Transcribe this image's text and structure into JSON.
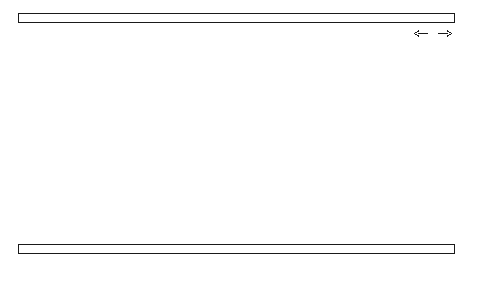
{
  "figure": {
    "kind": "nmr-spectrum",
    "background_color": "#ffffff",
    "line_color": "#1a1a1a",
    "trace_color": "#3a3a3a"
  },
  "annotation": {
    "label": "H",
    "left_arrow": "←",
    "right_arrow": "→",
    "name": "sweep-direction-marker"
  },
  "axis": {
    "title": "ppm",
    "tick_labels": [
      "80",
      "60",
      "40",
      "20",
      "0"
    ],
    "tick_values": [
      80,
      60,
      40,
      20,
      0
    ],
    "minor_division_values": [
      90,
      80,
      70,
      60,
      50,
      40,
      30,
      20,
      10,
      0
    ],
    "range_ppm": [
      90.5,
      -2.0
    ],
    "direction": "decreasing-left-to-right"
  },
  "chart_data": {
    "type": "line",
    "title": "",
    "subtitle": "",
    "xlabel": "ppm",
    "ylabel": "",
    "xlim": [
      90.5,
      -2.0
    ],
    "ylim": [
      0,
      1
    ],
    "grid": false,
    "legend": null,
    "legend_position": "none",
    "annotations": [
      {
        "text": "←H→",
        "x_ppm": 6.0,
        "y_rel": 0.95,
        "note": "field sweep direction marker"
      }
    ],
    "series": [
      {
        "name": "13C NMR trace",
        "x_label": "chemical shift (ppm)",
        "y_label": "intensity (relative)",
        "baseline_y": 0.02,
        "baseline_start_ppm": 84.5,
        "baseline_end_ppm": -1.0,
        "peaks": [
          {
            "ppm": 78.6,
            "height_rel": 0.045,
            "width_ppm": 0.9,
            "label": "solvent multiplet a"
          },
          {
            "ppm": 77.5,
            "height_rel": 0.05,
            "width_ppm": 0.9,
            "label": "solvent multiplet b"
          },
          {
            "ppm": 76.4,
            "height_rel": 0.045,
            "width_ppm": 0.9,
            "label": "solvent multiplet c"
          },
          {
            "ppm": 68.8,
            "height_rel": 0.645,
            "width_ppm": 0.42,
            "label": "peak 1"
          },
          {
            "ppm": 31.6,
            "height_rel": 0.645,
            "width_ppm": 0.42,
            "label": "peak 2"
          },
          {
            "ppm": 22.9,
            "height_rel": 0.905,
            "width_ppm": 0.42,
            "label": "peak 3"
          },
          {
            "ppm": 10.1,
            "height_rel": 0.5,
            "width_ppm": 0.42,
            "label": "peak 4"
          }
        ]
      }
    ]
  },
  "layout": {
    "plot_left_px": 18,
    "plot_right_px": 470,
    "plot_top_px": 23,
    "plot_bottom_px": 242,
    "ruler_left_px": 18,
    "ruler_right_px": 455,
    "top_ruler_y_px": 13,
    "top_ruler_h_px": 10,
    "bottom_ruler_y_px": 244,
    "bottom_ruler_h_px": 10,
    "ppm_zero_px": 455,
    "px_per_ppm": 4.84
  }
}
